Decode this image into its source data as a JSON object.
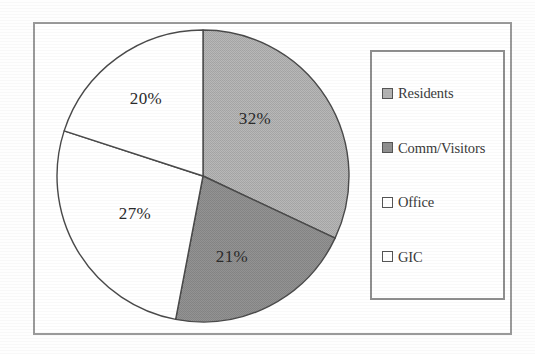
{
  "chart_data": {
    "type": "pie",
    "title": "",
    "subtitle": "",
    "xlabel": "",
    "ylabel": "",
    "legend_position": "right",
    "grid": false,
    "start_angle_deg": 0,
    "direction": "clockwise",
    "categories": [
      "Residents",
      "Comm/Visitors",
      "Office",
      "GIC"
    ],
    "values": [
      32,
      21,
      27,
      20
    ],
    "value_unit": "%",
    "data_labels": [
      "32%",
      "21%",
      "27%",
      "20%"
    ],
    "slice_colors": [
      "#b3b3b3",
      "#8f8f8f",
      "#ffffff",
      "#ffffff"
    ],
    "slice_edge_color": "#4a4a4a",
    "annotations": []
  },
  "frame": {
    "border_color": "#9a9a9a"
  },
  "pie": {
    "center_x": 203,
    "center_y": 176,
    "radius": 146,
    "slices": [
      {
        "label": "Residents",
        "value": 32,
        "display": "32%",
        "color": "#b3b3b3",
        "label_x": 255,
        "label_y": 120
      },
      {
        "label": "Comm/Visitors",
        "value": 21,
        "display": "21%",
        "color": "#8f8f8f",
        "label_x": 232,
        "label_y": 258
      },
      {
        "label": "Office",
        "value": 27,
        "display": "27%",
        "color": "#ffffff",
        "label_x": 135,
        "label_y": 215
      },
      {
        "label": "GIC",
        "value": 20,
        "display": "20%",
        "color": "#ffffff",
        "label_x": 146,
        "label_y": 100
      }
    ]
  },
  "legend": {
    "border_color": "#8f8f8f",
    "items": [
      {
        "label": "Residents",
        "swatch_color": "#b3b3b3"
      },
      {
        "label": "Comm/Visitors",
        "swatch_color": "#8f8f8f"
      },
      {
        "label": "Office",
        "swatch_color": "#ffffff"
      },
      {
        "label": "GIC",
        "swatch_color": "#ffffff"
      }
    ]
  }
}
